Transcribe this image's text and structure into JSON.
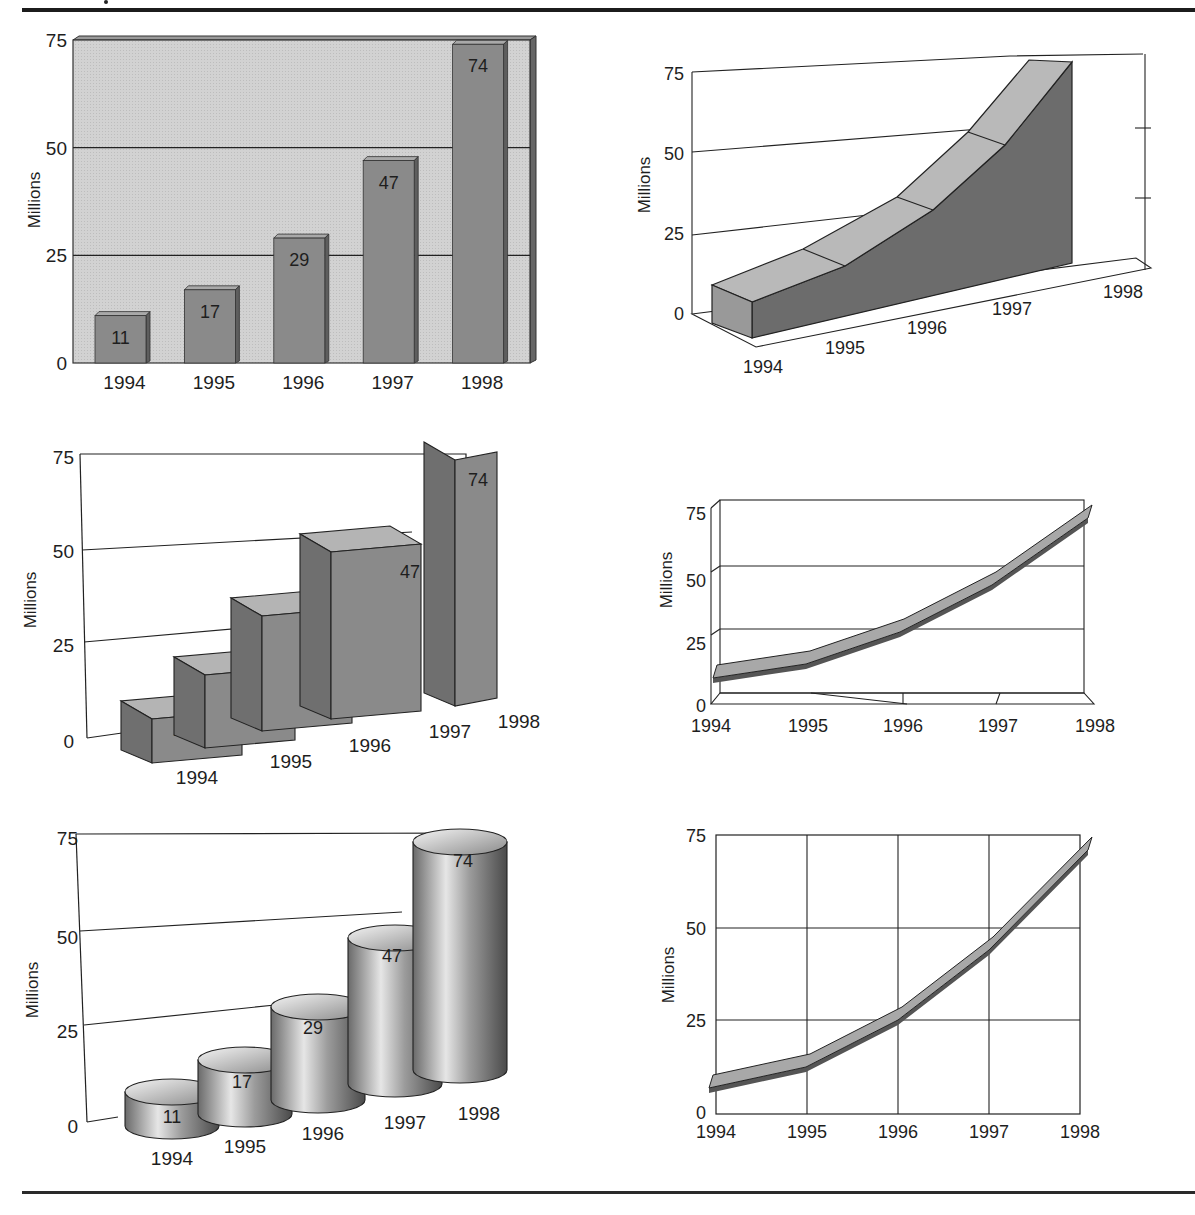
{
  "page": {
    "shared": {
      "ylabel": "Millions",
      "categories": [
        "1994",
        "1995",
        "1996",
        "1997",
        "1998"
      ],
      "values": [
        11,
        17,
        29,
        47,
        74
      ],
      "value_labels": [
        "11",
        "17",
        "29",
        "47",
        "74"
      ],
      "y_ticks": [
        "0",
        "25",
        "50",
        "75"
      ]
    },
    "colors": {
      "bar_face": "#8a8a8a",
      "bar_side": "#5e5e5e",
      "bar_top": "#b4b4b4",
      "plot_bg": "#d2d2d2",
      "ribbon_top": "#b9b9b9",
      "ribbon_front": "#6c6c6c",
      "ribbon_line": "#a8a8a8",
      "rule": "#1c1c1c"
    }
  },
  "chart_data": [
    {
      "id": "bar-2d-shadow",
      "type": "bar",
      "style": "2D bars with 3D depth, shaded plot background, value labels",
      "categories": [
        "1994",
        "1995",
        "1996",
        "1997",
        "1998"
      ],
      "values": [
        11,
        17,
        29,
        47,
        74
      ],
      "title": "",
      "xlabel": "",
      "ylabel": "Millions",
      "ylim": [
        0,
        75
      ],
      "yticks": [
        0,
        25,
        50,
        75
      ],
      "grid": "horizontal",
      "legend": "none",
      "data_labels": true
    },
    {
      "id": "area-3d",
      "type": "area",
      "style": "3D ribbon/area in perspective",
      "categories": [
        "1994",
        "1995",
        "1996",
        "1997",
        "1998"
      ],
      "values": [
        11,
        17,
        29,
        47,
        74
      ],
      "title": "",
      "xlabel": "",
      "ylabel": "Millions",
      "ylim": [
        0,
        75
      ],
      "yticks": [
        0,
        25,
        50,
        75
      ],
      "grid": "horizontal",
      "legend": "none",
      "data_labels": false
    },
    {
      "id": "bar-3d-perspective",
      "type": "bar",
      "style": "3D boxes in perspective, value labels",
      "categories": [
        "1994",
        "1995",
        "1996",
        "1997",
        "1998"
      ],
      "values": [
        11,
        17,
        29,
        47,
        74
      ],
      "title": "",
      "xlabel": "",
      "ylabel": "Millions",
      "ylim": [
        0,
        75
      ],
      "yticks": [
        0,
        25,
        50,
        75
      ],
      "grid": "horizontal",
      "legend": "none",
      "data_labels": true
    },
    {
      "id": "line-3d-ribbon",
      "type": "line",
      "style": "3D ribbon line in perspective frame",
      "categories": [
        "1994",
        "1995",
        "1996",
        "1997",
        "1998"
      ],
      "values": [
        11,
        17,
        29,
        47,
        74
      ],
      "title": "",
      "xlabel": "",
      "ylabel": "Millions",
      "ylim": [
        0,
        75
      ],
      "yticks": [
        0,
        25,
        50,
        75
      ],
      "grid": "horizontal",
      "legend": "none",
      "data_labels": false
    },
    {
      "id": "cylinder-3d",
      "type": "bar",
      "style": "3D cylinders in perspective, value labels",
      "categories": [
        "1994",
        "1995",
        "1996",
        "1997",
        "1998"
      ],
      "values": [
        11,
        17,
        29,
        47,
        74
      ],
      "title": "",
      "xlabel": "",
      "ylabel": "Millions",
      "ylim": [
        0,
        75
      ],
      "yticks": [
        0,
        25,
        50,
        75
      ],
      "grid": "horizontal",
      "legend": "none",
      "data_labels": true
    },
    {
      "id": "line-ribbon-grid",
      "type": "line",
      "style": "ribbon line on full grid",
      "categories": [
        "1994",
        "1995",
        "1996",
        "1997",
        "1998"
      ],
      "values": [
        11,
        17,
        29,
        47,
        74
      ],
      "title": "",
      "xlabel": "",
      "ylabel": "Millions",
      "ylim": [
        0,
        75
      ],
      "yticks": [
        0,
        25,
        50,
        75
      ],
      "grid": "both",
      "legend": "none",
      "data_labels": false
    }
  ]
}
